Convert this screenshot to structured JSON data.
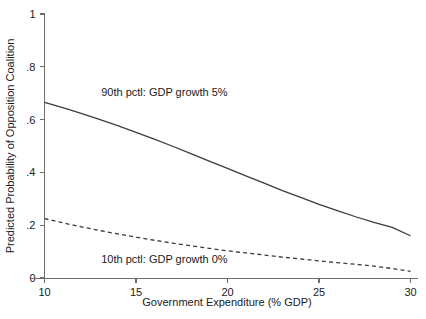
{
  "chart_data": {
    "type": "line",
    "title": "",
    "xlabel": "Government Expenditure (% GDP)",
    "ylabel": "Predicted Probability of Opposition Coalition",
    "xlim": [
      10,
      30
    ],
    "ylim": [
      0,
      1
    ],
    "xticks": [
      10,
      15,
      20,
      25,
      30
    ],
    "xtick_labels": [
      "10",
      "15",
      "20",
      "25",
      "30"
    ],
    "yticks": [
      0,
      0.2,
      0.4,
      0.6,
      0.8,
      1
    ],
    "ytick_labels": [
      "0",
      ".2",
      ".4",
      ".6",
      ".8",
      "1"
    ],
    "grid": false,
    "legend_position": "inline-annotations",
    "x": [
      10,
      11,
      12,
      13,
      14,
      15,
      16,
      17,
      18,
      19,
      20,
      21,
      22,
      23,
      24,
      25,
      26,
      27,
      28,
      29,
      30
    ],
    "series": [
      {
        "name": "90th pctl: GDP growth 5%",
        "style": "solid",
        "color": "#3b3b3b",
        "values": [
          0.665,
          0.645,
          0.624,
          0.601,
          0.577,
          0.552,
          0.526,
          0.499,
          0.471,
          0.443,
          0.415,
          0.387,
          0.359,
          0.331,
          0.305,
          0.279,
          0.255,
          0.232,
          0.211,
          0.192,
          0.16
        ]
      },
      {
        "name": "10th pctl: GDP growth 0%",
        "style": "dashed",
        "color": "#3b3b3b",
        "values": [
          0.225,
          0.209,
          0.194,
          0.18,
          0.167,
          0.155,
          0.143,
          0.132,
          0.122,
          0.112,
          0.103,
          0.095,
          0.087,
          0.079,
          0.072,
          0.065,
          0.058,
          0.052,
          0.045,
          0.036,
          0.025
        ]
      }
    ],
    "annotations": [
      {
        "text": "90th pctl: GDP growth 5%",
        "x": 13.1,
        "y": 0.69,
        "series": "90th pctl: GDP growth 5%"
      },
      {
        "text": "10th pctl: GDP growth 0%",
        "x": 13.1,
        "y": 0.055,
        "series": "10th pctl: GDP growth 0%"
      }
    ]
  }
}
